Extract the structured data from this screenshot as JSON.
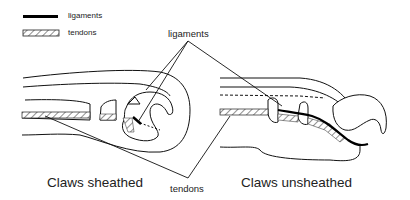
{
  "legend": {
    "items": [
      {
        "label": "ligaments",
        "style": "solid-thick-line",
        "color": "#000000"
      },
      {
        "label": "tendons",
        "style": "hatched-band",
        "color": "#555555"
      }
    ]
  },
  "callouts": {
    "ligaments": "ligaments",
    "tendons": "tendons"
  },
  "panels": [
    {
      "caption": "Claws sheathed"
    },
    {
      "caption": "Claws unsheathed"
    }
  ],
  "colors": {
    "stroke": "#111111",
    "background": "#ffffff"
  }
}
